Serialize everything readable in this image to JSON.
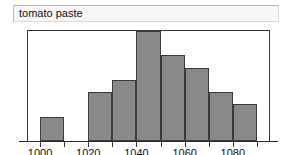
{
  "title": {
    "label": "tomato paste"
  },
  "chart_data": {
    "type": "bar",
    "title": "tomato paste",
    "xlabel": "",
    "ylabel": "",
    "grid": false,
    "legend": false,
    "bin_width": 10,
    "xlim": [
      995,
      1095
    ],
    "ylim": [
      0,
      9
    ],
    "categories": [
      "1000-1010",
      "1010-1020",
      "1020-1030",
      "1030-1040",
      "1040-1050",
      "1050-1060",
      "1060-1070",
      "1070-1080",
      "1080-1090"
    ],
    "bin_starts": [
      1000,
      1010,
      1020,
      1030,
      1040,
      1050,
      1060,
      1070,
      1080
    ],
    "values": [
      2,
      0,
      4,
      5,
      9,
      7,
      6,
      4,
      3
    ],
    "tick_values": [
      1000,
      1010,
      1020,
      1030,
      1040,
      1050,
      1060,
      1070,
      1080,
      1090
    ],
    "tick_labels": [
      "1000",
      "",
      "1020",
      "",
      "1040",
      "",
      "1060",
      "",
      "1080",
      ""
    ],
    "bar_color": "#898989",
    "bar_border_color": "#3b3b3b",
    "frame_color": "#3a3a3a",
    "background_color": "#ffffff"
  }
}
